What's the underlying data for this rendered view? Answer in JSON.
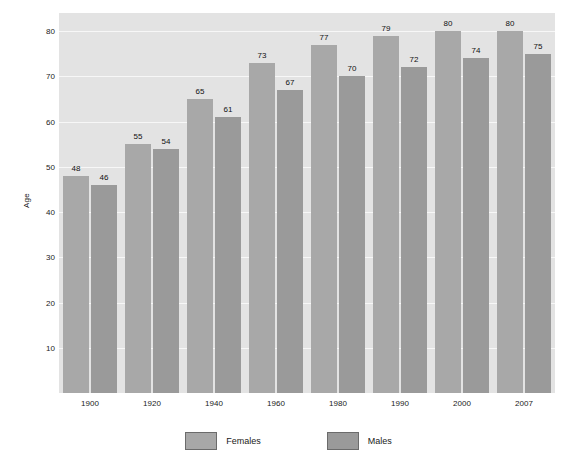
{
  "chart_data": {
    "type": "bar",
    "title": "",
    "xlabel": "",
    "ylabel": "Age",
    "categories": [
      "1900",
      "1920",
      "1940",
      "1960",
      "1980",
      "1990",
      "2000",
      "2007"
    ],
    "series": [
      {
        "name": "Females",
        "values": [
          48,
          55,
          65,
          73,
          77,
          79,
          80,
          80
        ],
        "color": "#a8a8a8"
      },
      {
        "name": "Males",
        "values": [
          46,
          54,
          61,
          67,
          70,
          72,
          74,
          75
        ],
        "color": "#9a9a9a"
      }
    ],
    "ylim": [
      0,
      84
    ],
    "yticks": [
      10,
      20,
      30,
      40,
      50,
      60,
      70,
      80
    ],
    "ytick_labels": [
      "10",
      "20",
      "30",
      "40",
      "50",
      "60",
      "70",
      "80"
    ],
    "grid": true,
    "legend_position": "bottom",
    "data_labels": true,
    "plot_background": "#e3e3e3",
    "gridline_color": "#f7f7f7",
    "figure_background": "#ffffff"
  },
  "legend": {
    "items": [
      {
        "label": "Females"
      },
      {
        "label": "Males"
      }
    ]
  },
  "axes": {
    "y_title": "Age"
  }
}
